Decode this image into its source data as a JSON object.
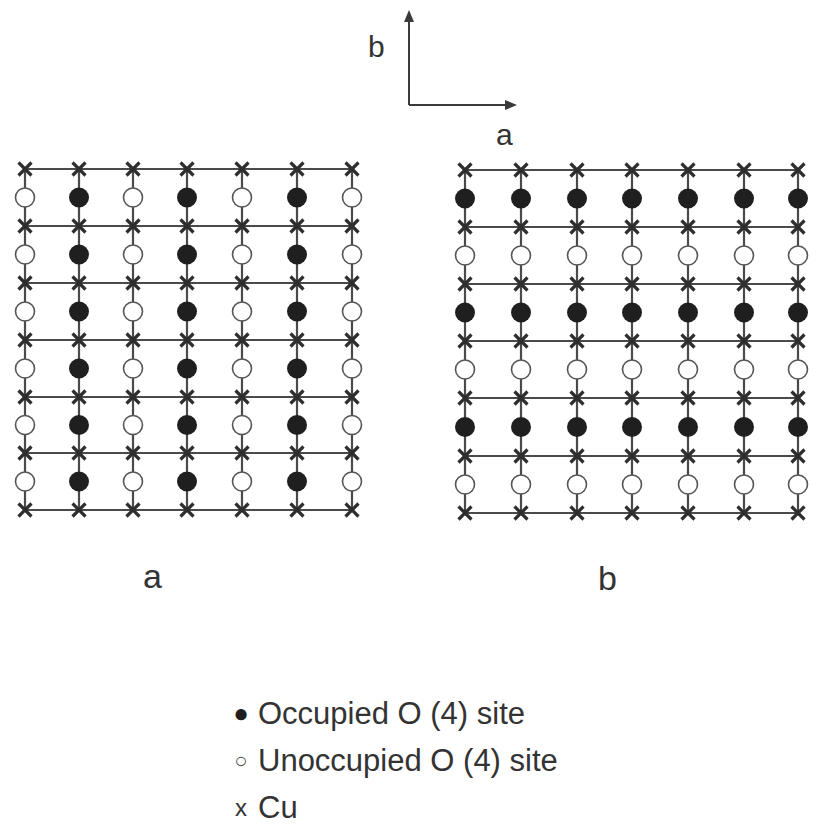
{
  "axes": {
    "b_label": "b",
    "a_label": "a"
  },
  "panels": [
    {
      "id": "a",
      "label": "a",
      "columns_x": [
        25,
        79,
        133,
        187,
        242,
        297,
        352
      ],
      "cu_rows_y": [
        169,
        226,
        283,
        340,
        397,
        453,
        510
      ],
      "pattern": "occupied_columns",
      "occupied_columns": [
        1,
        3,
        5
      ],
      "occupied_rows": []
    },
    {
      "id": "b",
      "label": "b",
      "columns_x": [
        465,
        521,
        577,
        632,
        688,
        744,
        798
      ],
      "cu_rows_y": [
        170,
        227,
        284,
        341,
        398,
        456,
        513
      ],
      "pattern": "occupied_rows",
      "occupied_columns": [],
      "occupied_rows": [
        0,
        2,
        4
      ]
    }
  ],
  "legend": {
    "occupied": {
      "symbol": "●",
      "label": "Occupied O (4) site"
    },
    "unoccupied": {
      "symbol": "○",
      "label": "Unoccupied O (4) site"
    },
    "cu": {
      "symbol": "x",
      "label": "Cu"
    }
  },
  "colors": {
    "line": "#4a4a4a",
    "cu": "#2e2e2e",
    "occupied_fill": "#1f1f1f",
    "unoccupied_fill": "#ffffff",
    "unoccupied_stroke": "#555555"
  }
}
